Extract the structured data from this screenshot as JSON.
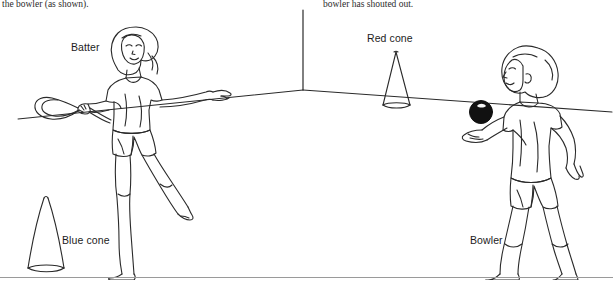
{
  "page": {
    "width": 613,
    "height": 296,
    "background_color": "#ffffff",
    "ink_color": "#1f1f1f",
    "rule_color": "#9a9a9a"
  },
  "body_text": {
    "left_fragment": "the bowler (as shown).",
    "right_fragment": "bowler has shouted out."
  },
  "illustration": {
    "description": "Line drawing of a batter with a bat facing a bowler holding a ball, with a red cone and a blue cone marking the playing area inside a room corner.",
    "scene": {
      "room_corner": "vertical wall corner line meeting two receding floor lines",
      "ball_color": "#111111"
    },
    "labels": {
      "batter": "Batter",
      "red_cone": "Red cone",
      "blue_cone": "Blue cone",
      "bowler": "Bowler"
    },
    "figures": [
      {
        "name": "batter",
        "role": "girl holding a bat, arm extended"
      },
      {
        "name": "bowler",
        "role": "boy holding a ball in an open hand"
      }
    ],
    "cones": [
      {
        "name": "red-cone",
        "label": "Red cone",
        "shape": "short wide cone"
      },
      {
        "name": "blue-cone",
        "label": "Blue cone",
        "shape": "tall narrow cone"
      }
    ]
  }
}
